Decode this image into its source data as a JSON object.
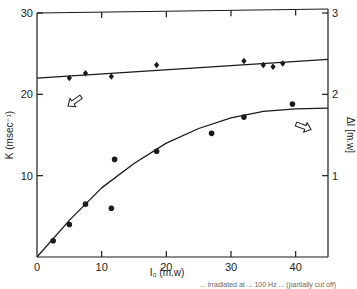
{
  "chart_data": {
    "type": "scatter",
    "title": "",
    "xlabel": "I0 (m.w)",
    "ylabel": "K (msec^-1)",
    "ylabel_right": "ΔI [m.w]",
    "xlim": [
      0,
      45
    ],
    "ylim": [
      0,
      30
    ],
    "ylim_right": [
      0,
      3
    ],
    "x_ticks": [
      0,
      10,
      20,
      30,
      40
    ],
    "y_ticks": [
      10,
      20,
      30
    ],
    "y_ticks_right": [
      1,
      2,
      3
    ],
    "grid": false,
    "legend": "none (arrows indicate axis for each series)",
    "series": [
      {
        "name": "K",
        "axis": "left",
        "marker": "diamond",
        "x": [
          5,
          7.5,
          11.5,
          18.5,
          32,
          35,
          36.5,
          38
        ],
        "y": [
          22.0,
          22.6,
          22.2,
          23.6,
          24.1,
          23.6,
          23.4,
          23.8
        ],
        "fit": {
          "type": "linear",
          "x": [
            0,
            45
          ],
          "y": [
            22.0,
            24.3
          ]
        }
      },
      {
        "name": "ΔI",
        "axis": "right",
        "marker": "circle",
        "x": [
          2.5,
          5,
          7.5,
          11.5,
          12,
          18.5,
          27,
          32,
          39.5
        ],
        "y": [
          0.2,
          0.4,
          0.65,
          0.6,
          1.2,
          1.3,
          1.52,
          1.72,
          1.88
        ],
        "fit": {
          "type": "saturating-curve",
          "x": [
            0,
            5,
            10,
            15,
            20,
            25,
            30,
            35,
            40,
            45
          ],
          "y": [
            0,
            0.45,
            0.85,
            1.15,
            1.4,
            1.58,
            1.71,
            1.79,
            1.82,
            1.83
          ]
        }
      }
    ],
    "annotations": [
      "left-pointing arrow below K line → left axis",
      "right-pointing arrow above ΔI curve → right axis"
    ]
  },
  "axes": {
    "x_ticks": [
      "0",
      "10",
      "20",
      "30",
      "40"
    ],
    "y_left_ticks": [
      "10",
      "20",
      "30"
    ],
    "y_right_ticks": [
      "1",
      "2",
      "3"
    ],
    "xlabel": "I₀ (m.w)",
    "ylabel_left": "K (msec⁻¹)",
    "ylabel_right": "ΔI [m.w]"
  },
  "caption": "... irradiated at ... 100 Hz ... (partially cut off)",
  "colors": {
    "ink": "#1a1a1a",
    "background": "#ffffff"
  }
}
